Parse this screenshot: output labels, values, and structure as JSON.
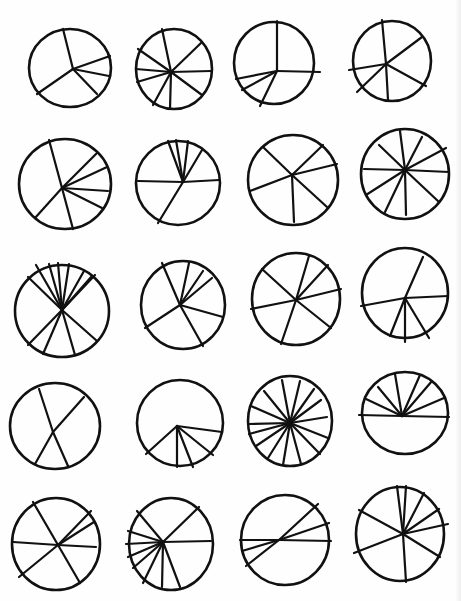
{
  "sheet": {
    "width": 461,
    "height": 601,
    "background": "#ffffff",
    "ink": "#111111",
    "stroke_width": 2.6
  },
  "chart_data": {
    "type": "other",
    "title": "",
    "grid": {
      "rows": 5,
      "cols": 4
    },
    "circles": [
      {
        "id": 1,
        "row": 1,
        "col": 1,
        "cx": 70,
        "cy": 68,
        "rx": 41,
        "ry": 39,
        "hub": [
          73,
          69
        ],
        "spokes": [
          [
            63,
            29
          ],
          [
            110,
            56
          ],
          [
            109,
            76
          ],
          [
            97,
            94
          ],
          [
            37,
            94
          ]
        ]
      },
      {
        "id": 2,
        "row": 1,
        "col": 2,
        "cx": 174,
        "cy": 69,
        "rx": 38,
        "ry": 40,
        "hub": [
          171,
          72
        ],
        "spokes": [
          [
            162,
            29
          ],
          [
            201,
            43
          ],
          [
            211,
            71
          ],
          [
            202,
            95
          ],
          [
            170,
            109
          ],
          [
            153,
            105
          ],
          [
            137,
            82
          ],
          [
            136,
            69
          ],
          [
            138,
            49
          ]
        ]
      },
      {
        "id": 3,
        "row": 1,
        "col": 3,
        "cx": 274,
        "cy": 63,
        "rx": 40,
        "ry": 41,
        "hub": [
          277,
          71
        ],
        "spokes": [
          [
            277,
            21
          ],
          [
            320,
            72
          ],
          [
            260,
            106
          ],
          [
            242,
            90
          ],
          [
            236,
            79
          ]
        ]
      },
      {
        "id": 4,
        "row": 1,
        "col": 4,
        "cx": 392,
        "cy": 61,
        "rx": 39,
        "ry": 40,
        "hub": [
          386,
          64
        ],
        "spokes": [
          [
            382,
            20
          ],
          [
            422,
            37
          ],
          [
            426,
            86
          ],
          [
            388,
            100
          ],
          [
            357,
            92
          ],
          [
            349,
            70
          ]
        ]
      },
      {
        "id": 5,
        "row": 2,
        "col": 1,
        "cx": 65,
        "cy": 184,
        "rx": 46,
        "ry": 45,
        "hub": [
          62,
          188
        ],
        "spokes": [
          [
            49,
            140
          ],
          [
            97,
            153
          ],
          [
            107,
            167
          ],
          [
            108,
            191
          ],
          [
            102,
            208
          ],
          [
            73,
            229
          ],
          [
            35,
            218
          ]
        ]
      },
      {
        "id": 6,
        "row": 2,
        "col": 2,
        "cx": 178,
        "cy": 183,
        "rx": 42,
        "ry": 42,
        "hub": [
          183,
          182
        ],
        "spokes": [
          [
            168,
            141
          ],
          [
            176,
            140
          ],
          [
            188,
            141
          ],
          [
            202,
            150
          ],
          [
            219,
            180
          ],
          [
            158,
            223
          ],
          [
            138,
            181
          ]
        ]
      },
      {
        "id": 7,
        "row": 2,
        "col": 3,
        "cx": 293,
        "cy": 180,
        "rx": 45,
        "ry": 45,
        "hub": [
          292,
          175
        ],
        "spokes": [
          [
            263,
            147
          ],
          [
            323,
            145
          ],
          [
            337,
            164
          ],
          [
            327,
            207
          ],
          [
            294,
            222
          ],
          [
            250,
            191
          ]
        ]
      },
      {
        "id": 8,
        "row": 2,
        "col": 4,
        "cx": 405,
        "cy": 174,
        "rx": 44,
        "ry": 45,
        "hub": [
          405,
          170
        ],
        "spokes": [
          [
            400,
            131
          ],
          [
            422,
            137
          ],
          [
            446,
            148
          ],
          [
            449,
            172
          ],
          [
            439,
            202
          ],
          [
            406,
            215
          ],
          [
            385,
            212
          ],
          [
            366,
            195
          ],
          [
            364,
            169
          ],
          [
            379,
            145
          ]
        ]
      },
      {
        "id": 9,
        "row": 3,
        "col": 1,
        "cx": 62,
        "cy": 311,
        "rx": 47,
        "ry": 46,
        "hub": [
          62,
          310
        ],
        "spokes": [
          [
            36,
            265
          ],
          [
            49,
            264
          ],
          [
            58,
            263
          ],
          [
            69,
            264
          ],
          [
            84,
            271
          ],
          [
            92,
            276
          ],
          [
            95,
            275
          ],
          [
            28,
            277
          ],
          [
            97,
            341
          ],
          [
            28,
            345
          ],
          [
            43,
            354
          ],
          [
            75,
            355
          ]
        ]
      },
      {
        "id": 10,
        "row": 3,
        "col": 2,
        "cx": 183,
        "cy": 305,
        "rx": 42,
        "ry": 44,
        "hub": [
          180,
          305
        ],
        "spokes": [
          [
            162,
            263
          ],
          [
            189,
            263
          ],
          [
            203,
            271
          ],
          [
            212,
            278
          ],
          [
            223,
            317
          ],
          [
            203,
            346
          ],
          [
            145,
            328
          ]
        ]
      },
      {
        "id": 11,
        "row": 3,
        "col": 3,
        "cx": 296,
        "cy": 299,
        "rx": 44,
        "ry": 46,
        "hub": [
          296,
          300
        ],
        "spokes": [
          [
            262,
            269
          ],
          [
            309,
            256
          ],
          [
            328,
            265
          ],
          [
            341,
            289
          ],
          [
            331,
            328
          ],
          [
            281,
            344
          ],
          [
            251,
            309
          ]
        ]
      },
      {
        "id": 12,
        "row": 3,
        "col": 4,
        "cx": 405,
        "cy": 293,
        "rx": 43,
        "ry": 45,
        "hub": [
          405,
          298
        ],
        "spokes": [
          [
            423,
            257
          ],
          [
            448,
            296
          ],
          [
            429,
            338
          ],
          [
            405,
            342
          ],
          [
            390,
            336
          ],
          [
            361,
            306
          ]
        ]
      },
      {
        "id": 13,
        "row": 4,
        "col": 1,
        "cx": 55,
        "cy": 426,
        "rx": 45,
        "ry": 43,
        "hub": [
          53,
          432
        ],
        "spokes": [
          [
            39,
            389
          ],
          [
            84,
            397
          ],
          [
            35,
            464
          ],
          [
            68,
            466
          ]
        ]
      },
      {
        "id": 14,
        "row": 4,
        "col": 2,
        "cx": 180,
        "cy": 423,
        "rx": 43,
        "ry": 43,
        "hub": [
          177,
          426
        ],
        "spokes": [
          [
            222,
            432
          ],
          [
            213,
            455
          ],
          [
            193,
            467
          ],
          [
            177,
            467
          ],
          [
            146,
            454
          ]
        ]
      },
      {
        "id": 15,
        "row": 4,
        "col": 3,
        "cx": 290,
        "cy": 421,
        "rx": 42,
        "ry": 45,
        "hub": [
          290,
          423
        ],
        "spokes": [
          [
            282,
            380
          ],
          [
            300,
            381
          ],
          [
            314,
            389
          ],
          [
            321,
            400
          ],
          [
            327,
            417
          ],
          [
            328,
            438
          ],
          [
            320,
            454
          ],
          [
            301,
            464
          ],
          [
            283,
            465
          ],
          [
            268,
            458
          ],
          [
            256,
            446
          ],
          [
            249,
            434
          ],
          [
            249,
            424
          ],
          [
            251,
            406
          ],
          [
            264,
            391
          ]
        ]
      },
      {
        "id": 16,
        "row": 4,
        "col": 4,
        "cx": 405,
        "cy": 413,
        "rx": 43,
        "ry": 41,
        "hub": [
          402,
          416
        ],
        "spokes": [
          [
            359,
            415
          ],
          [
            449,
            417
          ],
          [
            366,
            399
          ],
          [
            378,
            387
          ],
          [
            395,
            374
          ],
          [
            420,
            375
          ],
          [
            432,
            381
          ],
          [
            444,
            398
          ]
        ]
      },
      {
        "id": 17,
        "row": 5,
        "col": 1,
        "cx": 56,
        "cy": 544,
        "rx": 44,
        "ry": 46,
        "hub": [
          58,
          545
        ],
        "spokes": [
          [
            13,
            542
          ],
          [
            33,
            502
          ],
          [
            91,
            511
          ],
          [
            94,
            522
          ],
          [
            96,
            547
          ],
          [
            80,
            583
          ],
          [
            19,
            577
          ]
        ]
      },
      {
        "id": 18,
        "row": 5,
        "col": 2,
        "cx": 171,
        "cy": 544,
        "rx": 42,
        "ry": 46,
        "hub": [
          163,
          542
        ],
        "spokes": [
          [
            137,
            511
          ],
          [
            199,
            507
          ],
          [
            211,
            541
          ],
          [
            180,
            587
          ],
          [
            162,
            587
          ],
          [
            143,
            583
          ],
          [
            133,
            568
          ],
          [
            128,
            557
          ],
          [
            126,
            544
          ],
          [
            128,
            531
          ]
        ]
      },
      {
        "id": 19,
        "row": 5,
        "col": 3,
        "cx": 285,
        "cy": 540,
        "rx": 44,
        "ry": 45,
        "hub": [
          279,
          540
        ],
        "spokes": [
          [
            318,
            504
          ],
          [
            329,
            523
          ],
          [
            331,
            541
          ],
          [
            240,
            540
          ],
          [
            242,
            551
          ],
          [
            246,
            566
          ]
        ]
      },
      {
        "id": 20,
        "row": 5,
        "col": 4,
        "cx": 400,
        "cy": 534,
        "rx": 44,
        "ry": 47,
        "hub": [
          403,
          534
        ],
        "spokes": [
          [
            397,
            486
          ],
          [
            406,
            486
          ],
          [
            424,
            493
          ],
          [
            439,
            509
          ],
          [
            448,
            524
          ],
          [
            440,
            557
          ],
          [
            406,
            582
          ],
          [
            354,
            553
          ],
          [
            359,
            510
          ]
        ]
      }
    ]
  }
}
